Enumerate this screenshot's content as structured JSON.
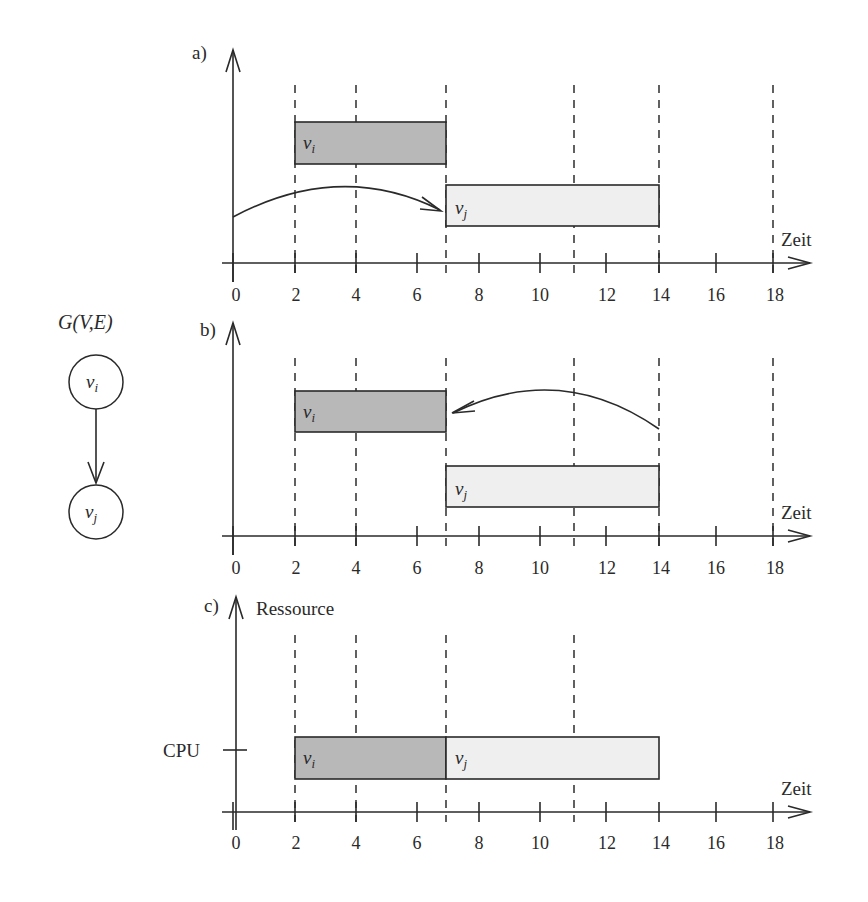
{
  "graph": {
    "title": "G(V,E)",
    "node_i": "v",
    "node_i_sub": "i",
    "node_j": "v",
    "node_j_sub": "j"
  },
  "axis": {
    "x_label": "Zeit",
    "y_label_c": "Ressource",
    "cpu_label": "CPU",
    "ticks": [
      "0",
      "2",
      "4",
      "6",
      "8",
      "10",
      "12",
      "14",
      "16",
      "18"
    ],
    "tick_values": [
      0,
      2,
      4,
      6,
      8,
      10,
      12,
      14,
      16,
      18
    ],
    "tick_px": [
      233,
      295,
      356,
      417,
      479,
      540,
      606,
      659,
      716,
      773
    ]
  },
  "panels": [
    {
      "label": "a)",
      "description": "ASAP: v_i runs 2-7, v_j runs 7-14; arrow from v_i start to v_j",
      "dashed_at": [
        2,
        4,
        7,
        11,
        14,
        18
      ],
      "v_i": {
        "start": 2,
        "end": 7
      },
      "v_j": {
        "start": 7,
        "end": 14
      }
    },
    {
      "label": "b)",
      "description": "ALAP: v_j runs 7-14, v_i runs 2-7; arrow from v_j end back to v_i",
      "dashed_at": [
        2,
        4,
        7,
        11,
        14,
        18
      ],
      "v_i": {
        "start": 2,
        "end": 7
      },
      "v_j": {
        "start": 7,
        "end": 14
      }
    },
    {
      "label": "c)",
      "description": "Resource schedule on CPU: v_i 2-7 followed by v_j 7-14",
      "dashed_at": [
        2,
        4,
        7,
        11
      ],
      "v_i": {
        "start": 2,
        "end": 7
      },
      "v_j": {
        "start": 7,
        "end": 14
      }
    }
  ],
  "colors": {
    "v_i_fill": "#b8b8b8",
    "v_j_fill": "#efefef",
    "ink": "#2a2a2a"
  }
}
